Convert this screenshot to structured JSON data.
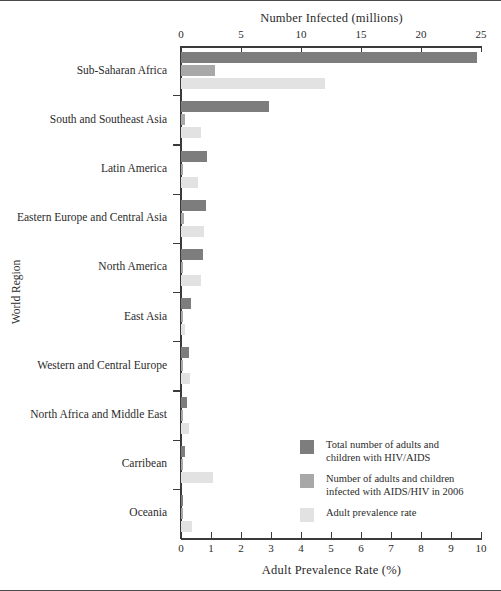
{
  "chart_data": {
    "type": "bar",
    "orientation": "horizontal",
    "title": "",
    "top_axis": {
      "label": "Number Infected (millions)",
      "ticks": [
        0,
        5,
        10,
        15,
        20,
        25
      ],
      "range": [
        0,
        25
      ]
    },
    "bottom_axis": {
      "label": "Adult Prevalence Rate (%)",
      "ticks": [
        0,
        1,
        2,
        3,
        4,
        5,
        6,
        7,
        8,
        9,
        10
      ],
      "range": [
        0,
        10
      ]
    },
    "ylabel": "World Region",
    "grid": false,
    "legend_position": "inside-bottom-right",
    "categories": [
      "Sub-Saharan Africa",
      "South and Southeast Asia",
      "Latin America",
      "Eastern Europe and Central Asia",
      "North America",
      "East Asia",
      "Western and Central Europe",
      "North  Africa and Middle East",
      "Carribean",
      "Oceania"
    ],
    "series": [
      {
        "name": "Total number of adults and children with HIV/AIDS",
        "key": "total_millions",
        "axis": "top",
        "unit": "millions",
        "color": "#7d7d7d",
        "values": [
          24.7,
          7.3,
          2.2,
          2.1,
          1.8,
          0.8,
          0.7,
          0.5,
          0.3,
          0.08
        ]
      },
      {
        "name": "Number of adults and children infected with AIDS/HIV in 2006",
        "key": "new_2006_millions",
        "axis": "top",
        "unit": "millions",
        "color": "#a8a8a8",
        "values": [
          2.8,
          0.35,
          0.14,
          0.27,
          0.05,
          0.1,
          0.03,
          0.07,
          0.03,
          0.01
        ]
      },
      {
        "name": "Adult prevalence rate",
        "key": "prevalence_pct",
        "axis": "bottom",
        "unit": "%",
        "color": "#e2e2e2",
        "values": [
          4.8,
          0.65,
          0.55,
          0.75,
          0.65,
          0.12,
          0.3,
          0.25,
          1.05,
          0.35
        ]
      }
    ]
  },
  "legend": {
    "items": [
      {
        "swatch": "s1",
        "line1": "Total number of adults and",
        "line2": "children with HIV/AIDS"
      },
      {
        "swatch": "s2",
        "line1": "Number of adults and children",
        "line2": "infected with AIDS/HIV in 2006"
      },
      {
        "swatch": "s3",
        "line1": "Adult prevalence rate",
        "line2": ""
      }
    ]
  },
  "colors": {
    "series1": "#7d7d7d",
    "series2": "#a8a8a8",
    "series3": "#e2e2e2",
    "axis": "#3a3a3a",
    "text": "#2b2b2b",
    "background": "#ffffff"
  }
}
